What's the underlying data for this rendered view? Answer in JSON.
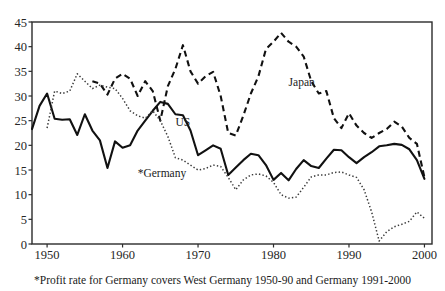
{
  "chart_data": {
    "type": "line",
    "title": "",
    "subtitle": "",
    "xlabel": "",
    "ylabel": "",
    "xlim": [
      1948,
      2001
    ],
    "ylim": [
      0,
      45
    ],
    "grid": false,
    "legend_position": "inline-annotations",
    "xticks": [
      "1950",
      "1960",
      "1970",
      "1980",
      "1990",
      "2000"
    ],
    "xtick_values": [
      1950,
      1960,
      1970,
      1980,
      1990,
      2000
    ],
    "yticks": [
      "0",
      "5",
      "10",
      "15",
      "20",
      "25",
      "30",
      "35",
      "40",
      "45"
    ],
    "ytick_values": [
      0,
      5,
      10,
      15,
      20,
      25,
      30,
      35,
      40,
      45
    ],
    "footnote": "*Profit rate for Germany covers West Germany 1950-90 and Germany 1991-2000",
    "x": [
      1948,
      1949,
      1950,
      1951,
      1952,
      1953,
      1954,
      1955,
      1956,
      1957,
      1958,
      1959,
      1960,
      1961,
      1962,
      1963,
      1964,
      1965,
      1966,
      1967,
      1968,
      1969,
      1970,
      1971,
      1972,
      1973,
      1974,
      1975,
      1976,
      1977,
      1978,
      1979,
      1980,
      1981,
      1982,
      1983,
      1984,
      1985,
      1986,
      1987,
      1988,
      1989,
      1990,
      1991,
      1992,
      1993,
      1994,
      1995,
      1996,
      1997,
      1998,
      1999,
      2000
    ],
    "series": [
      {
        "name": "US",
        "style": "solid",
        "color": "#111111",
        "values": [
          23.3,
          28.0,
          30.5,
          25.4,
          25.2,
          25.3,
          22.1,
          26.3,
          23.0,
          21.0,
          15.4,
          20.8,
          19.5,
          20.0,
          23.0,
          25.0,
          27.0,
          28.8,
          28.4,
          26.3,
          26.1,
          23.0,
          18.0,
          19.0,
          20.0,
          19.3,
          14.0,
          15.5,
          17.0,
          18.3,
          18.0,
          16.0,
          13.0,
          14.4,
          12.9,
          15.2,
          17.0,
          15.8,
          15.4,
          17.3,
          19.1,
          19.0,
          17.6,
          16.4,
          17.6,
          18.6,
          19.8,
          20.0,
          20.3,
          20.1,
          19.2,
          17.0,
          13.2
        ]
      },
      {
        "name": "Japan",
        "style": "dashed",
        "color": "#111111",
        "values": [
          null,
          null,
          null,
          null,
          null,
          null,
          null,
          null,
          33.0,
          32.5,
          30.3,
          33.5,
          34.5,
          33.5,
          30.0,
          33.0,
          31.0,
          25.0,
          32.0,
          35.5,
          40.3,
          35.0,
          32.5,
          34.0,
          34.9,
          30.0,
          22.5,
          22.0,
          26.0,
          30.5,
          34.0,
          39.5,
          41.0,
          42.8,
          41.0,
          40.0,
          38.0,
          33.0,
          30.5,
          31.0,
          25.5,
          23.5,
          26.5,
          24.0,
          22.5,
          21.5,
          22.5,
          23.3,
          24.8,
          23.8,
          21.5,
          20.3,
          13.5
        ]
      },
      {
        "name": "*Germany",
        "style": "dotted",
        "color": "#3a3a3a",
        "values": [
          null,
          null,
          23.5,
          31.0,
          30.5,
          31.0,
          34.5,
          33.0,
          31.5,
          32.2,
          31.8,
          31.5,
          29.5,
          27.0,
          26.0,
          25.5,
          27.0,
          25.0,
          21.8,
          17.5,
          17.0,
          16.0,
          15.0,
          15.3,
          16.0,
          15.7,
          13.5,
          11.0,
          13.0,
          14.0,
          14.2,
          13.8,
          12.5,
          10.0,
          9.3,
          9.5,
          11.5,
          13.6,
          14.0,
          14.0,
          14.5,
          14.6,
          14.0,
          13.5,
          11.0,
          6.5,
          0.6,
          2.5,
          3.5,
          4.0,
          4.6,
          6.5,
          5.2
        ]
      }
    ],
    "annotations": [
      {
        "label": "Japan",
        "x": 1982,
        "y": 32.0
      },
      {
        "label": "US",
        "x": 1967,
        "y": 24.0
      },
      {
        "label": "*Germany",
        "x": 1962,
        "y": 13.5
      }
    ]
  }
}
